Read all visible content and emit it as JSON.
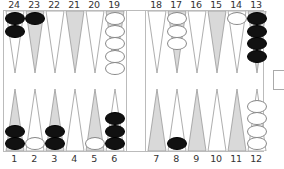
{
  "board": {
    "colors": {
      "light_point": "#ffffff",
      "dark_point": "#d9d9d9",
      "point_stroke": "#999999",
      "black_checker": "#111111",
      "white_checker": "#ffffff"
    },
    "top_labels": [
      "24",
      "23",
      "22",
      "21",
      "20",
      "19",
      "18",
      "17",
      "16",
      "15",
      "14",
      "13"
    ],
    "bottom_labels": [
      "1",
      "2",
      "3",
      "4",
      "5",
      "6",
      "7",
      "8",
      "9",
      "10",
      "11",
      "12"
    ],
    "points": {
      "1": {
        "color": "black",
        "count": 2
      },
      "2": {
        "color": "white",
        "count": 1
      },
      "3": {
        "color": "black",
        "count": 2
      },
      "4": {
        "color": "none",
        "count": 0
      },
      "5": {
        "color": "white",
        "count": 1
      },
      "6": {
        "color": "black",
        "count": 3
      },
      "7": {
        "color": "none",
        "count": 0
      },
      "8": {
        "color": "black",
        "count": 1
      },
      "9": {
        "color": "none",
        "count": 0
      },
      "10": {
        "color": "none",
        "count": 0
      },
      "11": {
        "color": "none",
        "count": 0
      },
      "12": {
        "color": "white",
        "count": 4
      },
      "13": {
        "color": "black",
        "count": 4
      },
      "14": {
        "color": "white",
        "count": 1
      },
      "15": {
        "color": "none",
        "count": 0
      },
      "16": {
        "color": "none",
        "count": 0
      },
      "17": {
        "color": "white",
        "count": 3
      },
      "18": {
        "color": "none",
        "count": 0
      },
      "19": {
        "color": "white",
        "count": 5
      },
      "20": {
        "color": "none",
        "count": 0
      },
      "21": {
        "color": "none",
        "count": 0
      },
      "22": {
        "color": "none",
        "count": 0
      },
      "23": {
        "color": "black",
        "count": 1
      },
      "24": {
        "color": "black",
        "count": 2
      }
    }
  }
}
